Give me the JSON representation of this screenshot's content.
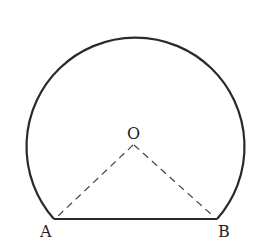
{
  "diagram": {
    "type": "geometry",
    "colors": {
      "stroke": "#2a2a2a",
      "dashed": "#444444",
      "background": "#ffffff"
    },
    "points": {
      "O": {
        "label": "O",
        "x": 133,
        "y": 143
      },
      "A": {
        "label": "A",
        "x": 54,
        "y": 219
      },
      "B": {
        "label": "B",
        "x": 217,
        "y": 219
      }
    },
    "segments": [
      {
        "from": "A",
        "to": "B",
        "style": "solid"
      },
      {
        "from": "O",
        "to": "A",
        "style": "dashed"
      },
      {
        "from": "O",
        "to": "B",
        "style": "dashed"
      }
    ],
    "arc": {
      "from": "A",
      "to": "B",
      "type": "major",
      "style": "solid"
    }
  }
}
